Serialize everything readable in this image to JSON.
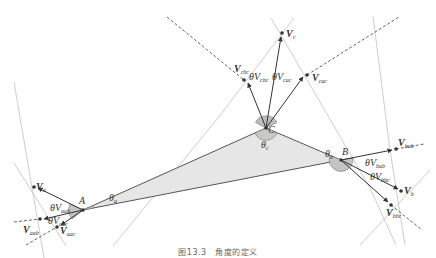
{
  "figure": {
    "caption": "图13.3　角度的定义",
    "colors": {
      "triangle_fill": "#e6e6e6",
      "triangle_stroke": "#555555",
      "angle_fill": "#bdbdbd",
      "line_gray": "#b5b5b5",
      "dashed": "#555555",
      "point": "#333333"
    }
  },
  "vertices": {
    "A": {
      "label": "A",
      "angle": "θ",
      "angle_sub": "a"
    },
    "B": {
      "label": "B",
      "angle": "θ",
      "angle_sub": "b"
    },
    "C": {
      "label": "C",
      "angle": "θ",
      "angle_sub": "c"
    }
  },
  "vectors": {
    "Va": {
      "main": "V",
      "sub": "a"
    },
    "Vaab": {
      "main": "V",
      "sub": "aab"
    },
    "Vaac": {
      "main": "V",
      "sub": "aac"
    },
    "Vb": {
      "main": "V",
      "sub": "b"
    },
    "Vbab": {
      "main": "V",
      "sub": "bab"
    },
    "Vbbc": {
      "main": "V",
      "sub": "bbc"
    },
    "Vc": {
      "main": "V",
      "sub": "c"
    },
    "Vcac": {
      "main": "V",
      "sub": "cac"
    },
    "Vcbc": {
      "main": "V",
      "sub": "cbc"
    }
  },
  "angles": {
    "dVaab": {
      "main": "θV",
      "sub": "aab"
    },
    "dVaac": {
      "main": "θV",
      "sub": "aac"
    },
    "dVbab": {
      "main": "θV",
      "sub": "bab"
    },
    "dVbbc": {
      "main": "θV",
      "sub": "bbc"
    },
    "dVcbc": {
      "main": "θV",
      "sub": "cbc"
    },
    "dVcac": {
      "main": "θV",
      "sub": "cac"
    }
  }
}
